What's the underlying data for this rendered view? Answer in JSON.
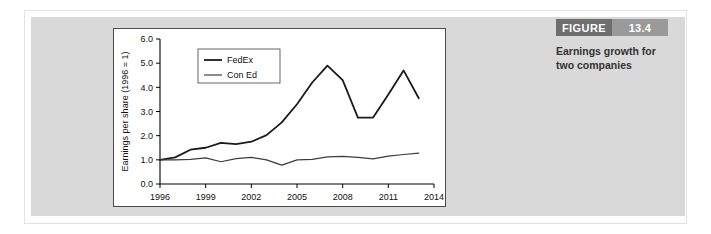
{
  "figure": {
    "badge_word": "FIGURE",
    "badge_number": "13.4",
    "caption_line1": "Earnings growth for",
    "caption_line2": "two companies",
    "badge_word_color": "#6e6e6e",
    "badge_number_color": "#9a9a9a",
    "panel_color": "#d9d9d9"
  },
  "chart_data": {
    "type": "line",
    "title": "",
    "xlabel": "",
    "ylabel": "Earnings per share (1996 = 1)",
    "xlim": [
      1996,
      2014
    ],
    "ylim": [
      0.0,
      6.0
    ],
    "grid": false,
    "legend_position": "upper-left",
    "x_tick_labels": [
      "1996",
      "1999",
      "2002",
      "2005",
      "2008",
      "2011",
      "2014"
    ],
    "x_ticks": [
      1996,
      1999,
      2002,
      2005,
      2008,
      2011,
      2014
    ],
    "y_tick_labels": [
      "0.0",
      "1.0",
      "2.0",
      "3.0",
      "4.0",
      "5.0",
      "6.0"
    ],
    "y_ticks": [
      0.0,
      1.0,
      2.0,
      3.0,
      4.0,
      5.0,
      6.0
    ],
    "x": [
      1996,
      1997,
      1998,
      1999,
      2000,
      2001,
      2002,
      2003,
      2004,
      2005,
      2006,
      2007,
      2008,
      2009,
      2010,
      2011,
      2012,
      2013
    ],
    "series": [
      {
        "name": "FedEx",
        "color": "#1a1a1a",
        "values": [
          1.0,
          1.1,
          1.42,
          1.5,
          1.7,
          1.65,
          1.75,
          2.02,
          2.55,
          3.3,
          4.2,
          4.9,
          4.3,
          2.75,
          2.75,
          3.7,
          4.7,
          3.55
        ]
      },
      {
        "name": "Con Ed",
        "color": "#3d3d3d",
        "values": [
          1.0,
          1.0,
          1.02,
          1.08,
          0.92,
          1.05,
          1.1,
          1.0,
          0.78,
          1.0,
          1.02,
          1.12,
          1.14,
          1.1,
          1.04,
          1.15,
          1.22,
          1.28
        ]
      }
    ]
  }
}
